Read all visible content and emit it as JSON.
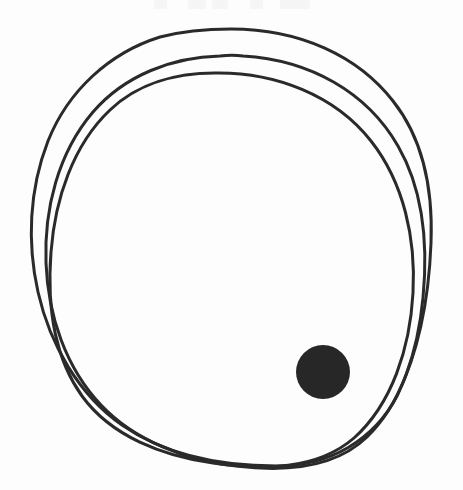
{
  "artwork": {
    "title": "Hand-drawn overlapping circles with filled dot",
    "medium": "ink line drawing on paper",
    "background_color": "#fdfdfd",
    "ink_color": "#2a2a2a",
    "canvas": {
      "width": 463,
      "height": 490
    }
  },
  "shapes": {
    "circles": [
      {
        "name": "outer-circle",
        "label": "Outer hand-drawn circle",
        "cx": 231,
        "cy": 247,
        "rx": 200,
        "ry": 218,
        "rotation_deg": -4,
        "stroke_width": 3,
        "color": "#2a2a2a"
      },
      {
        "name": "middle-circle",
        "label": "Middle hand-drawn circle",
        "cx": 236,
        "cy": 257,
        "rx": 192,
        "ry": 205,
        "rotation_deg": 6,
        "stroke_width": 3,
        "color": "#2a2a2a"
      },
      {
        "name": "inner-circle",
        "label": "Inner hand-drawn circle",
        "cx": 228,
        "cy": 266,
        "rx": 186,
        "ry": 196,
        "rotation_deg": -10,
        "stroke_width": 3,
        "color": "#2a2a2a"
      }
    ],
    "dot": {
      "name": "filled-dot",
      "label": "Solid filled dot inside lower-right of circles",
      "cx": 323,
      "cy": 372,
      "r": 27,
      "fill": "#272727"
    }
  },
  "annotations": {
    "top_edge_ghost": {
      "label": "Faint cropped text remnant at top edge",
      "visible_text": ""
    }
  }
}
